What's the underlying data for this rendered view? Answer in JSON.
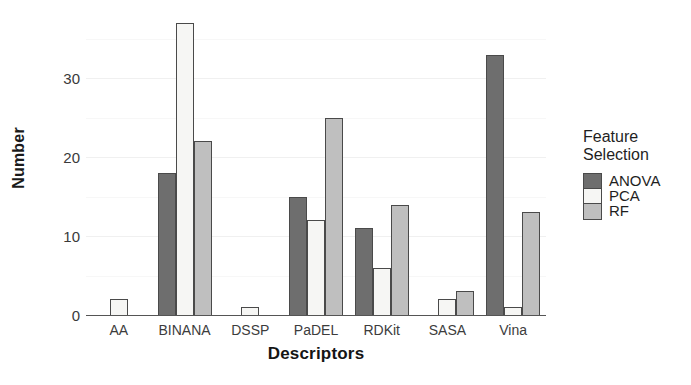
{
  "chart_data": {
    "type": "bar",
    "title": "",
    "xlabel": "Descriptors",
    "ylabel": "Number",
    "categories": [
      "AA",
      "BINANA",
      "DSSP",
      "PaDEL",
      "RDKit",
      "SASA",
      "Vina"
    ],
    "series": [
      {
        "name": "ANOVA",
        "color": "#6e6e6e",
        "values": [
          0,
          18,
          0,
          15,
          11,
          0,
          33
        ]
      },
      {
        "name": "PCA",
        "color": "#f6f6f4",
        "values": [
          2,
          37,
          1,
          12,
          6,
          2,
          1
        ]
      },
      {
        "name": "RF",
        "color": "#bfbfbf",
        "values": [
          0,
          22,
          0,
          25,
          14,
          3,
          13
        ]
      }
    ],
    "ylim": [
      0,
      38
    ],
    "yticks": [
      0,
      10,
      20,
      30
    ],
    "ytick_labels": [
      "0",
      "10",
      "20",
      "30"
    ],
    "grid": true,
    "legend_position": "right",
    "legend": {
      "title": "Feature\nSelection",
      "entries": [
        "ANOVA",
        "PCA",
        "RF"
      ]
    }
  },
  "axis": {
    "y_title": "Number",
    "x_title": "Descriptors"
  },
  "colors": {
    "anova": "#6e6e6e",
    "pca": "#f6f6f4",
    "rf": "#bfbfbf",
    "axis": "#555555",
    "grid": "#f0f0f0",
    "text": "#1f1f1f"
  }
}
